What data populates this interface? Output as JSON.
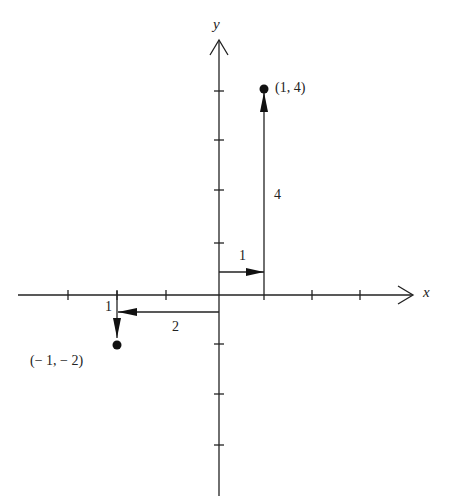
{
  "diagram": {
    "type": "coordinate-plane",
    "axes": {
      "x_label": "x",
      "y_label": "y",
      "origin_px": [
        219,
        295
      ],
      "unit_px": 48
    },
    "points": [
      {
        "label": "(1, 4)",
        "x": 1,
        "y": 4
      },
      {
        "label": "(− 1, − 2)",
        "x": -1,
        "y": -2
      }
    ],
    "paths": [
      {
        "to": "(1, 4)",
        "steps": [
          {
            "dir": "right",
            "label": "1"
          },
          {
            "dir": "up",
            "label": "4"
          }
        ]
      },
      {
        "to": "(-1, -2)",
        "steps": [
          {
            "dir": "left",
            "label": "2"
          },
          {
            "dir": "down",
            "label": "1"
          }
        ]
      }
    ]
  },
  "labels": {
    "x_axis": "x",
    "y_axis": "y",
    "point_a": "(1, 4)",
    "point_b": "(− 1, − 2)",
    "step_right_1": "1",
    "step_up_4": "4",
    "step_left_2": "2",
    "step_down_1": "1"
  },
  "colors": {
    "ink": "#222222",
    "background": "#ffffff"
  }
}
